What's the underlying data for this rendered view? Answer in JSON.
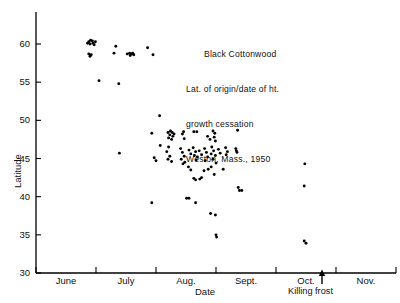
{
  "figure": {
    "title_lines": [
      "Black Cottonwood",
      "Lat. of origin/date of ht.",
      "growth cessation",
      "Weston, Mass., 1950"
    ],
    "frost_annotation": "Killing frost",
    "frost_arrow_icon": "up-arrow-icon"
  },
  "chart_data": {
    "type": "scatter",
    "title": "Black Cottonwood Lat. of origin/date of ht. growth cessation Weston, Mass., 1950",
    "xlabel": "Date",
    "ylabel": "Latitude",
    "ylim": [
      30,
      62
    ],
    "yticks": [
      30,
      35,
      40,
      45,
      50,
      55,
      60
    ],
    "ytick_labels": [
      "30",
      "35",
      "40",
      "45",
      "50",
      "55",
      "60"
    ],
    "xlim": [
      0,
      6
    ],
    "xtick_positions": [
      0,
      1,
      2,
      3,
      4,
      5,
      6
    ],
    "xtick_labels": [
      "June",
      "July",
      "Aug.",
      "Sept.",
      "Oct.",
      "Nov."
    ],
    "xlabel_positions": [
      0.5,
      1.5,
      2.5,
      3.5,
      4.5,
      5.5
    ],
    "grid": false,
    "legend": false,
    "annotations": [
      {
        "text": "Killing frost",
        "x": 4.95,
        "y": 30,
        "marker": "up-arrow"
      }
    ],
    "points": [
      {
        "x": 0.88,
        "y": 60.3
      },
      {
        "x": 0.91,
        "y": 60.5
      },
      {
        "x": 0.94,
        "y": 60.4
      },
      {
        "x": 0.9,
        "y": 60.0
      },
      {
        "x": 0.95,
        "y": 60.1
      },
      {
        "x": 0.99,
        "y": 60.3
      },
      {
        "x": 0.86,
        "y": 60.1
      },
      {
        "x": 0.97,
        "y": 59.9
      },
      {
        "x": 0.88,
        "y": 58.7
      },
      {
        "x": 0.92,
        "y": 58.6
      },
      {
        "x": 0.9,
        "y": 58.4
      },
      {
        "x": 1.33,
        "y": 59.7
      },
      {
        "x": 1.3,
        "y": 58.8
      },
      {
        "x": 1.52,
        "y": 58.7
      },
      {
        "x": 1.56,
        "y": 58.8
      },
      {
        "x": 1.6,
        "y": 58.7
      },
      {
        "x": 1.63,
        "y": 58.6
      },
      {
        "x": 1.57,
        "y": 58.5
      },
      {
        "x": 1.61,
        "y": 58.8
      },
      {
        "x": 1.86,
        "y": 59.5
      },
      {
        "x": 1.95,
        "y": 58.6
      },
      {
        "x": 1.05,
        "y": 55.2
      },
      {
        "x": 1.38,
        "y": 54.8
      },
      {
        "x": 1.39,
        "y": 45.7
      },
      {
        "x": 2.06,
        "y": 50.6
      },
      {
        "x": 1.93,
        "y": 48.3
      },
      {
        "x": 2.2,
        "y": 48.4
      },
      {
        "x": 2.24,
        "y": 48.6
      },
      {
        "x": 2.27,
        "y": 48.4
      },
      {
        "x": 2.23,
        "y": 48.1
      },
      {
        "x": 2.28,
        "y": 47.9
      },
      {
        "x": 2.21,
        "y": 47.7
      },
      {
        "x": 2.26,
        "y": 47.5
      },
      {
        "x": 2.3,
        "y": 48.2
      },
      {
        "x": 2.44,
        "y": 48.2
      },
      {
        "x": 2.47,
        "y": 47.6
      },
      {
        "x": 2.46,
        "y": 48.5
      },
      {
        "x": 2.63,
        "y": 48.5
      },
      {
        "x": 2.68,
        "y": 48.5
      },
      {
        "x": 2.95,
        "y": 48.6
      },
      {
        "x": 2.98,
        "y": 48.3
      },
      {
        "x": 3.36,
        "y": 48.7
      },
      {
        "x": 2.86,
        "y": 47.9
      },
      {
        "x": 2.9,
        "y": 47.5
      },
      {
        "x": 2.97,
        "y": 47.8
      },
      {
        "x": 2.99,
        "y": 47.3
      },
      {
        "x": 2.07,
        "y": 46.7
      },
      {
        "x": 2.21,
        "y": 46.5
      },
      {
        "x": 2.18,
        "y": 45.9
      },
      {
        "x": 2.23,
        "y": 45.3
      },
      {
        "x": 2.2,
        "y": 44.9
      },
      {
        "x": 2.26,
        "y": 44.6
      },
      {
        "x": 2.41,
        "y": 46.3
      },
      {
        "x": 2.44,
        "y": 45.8
      },
      {
        "x": 2.47,
        "y": 45.3
      },
      {
        "x": 2.42,
        "y": 44.9
      },
      {
        "x": 2.48,
        "y": 44.5
      },
      {
        "x": 2.45,
        "y": 44.3
      },
      {
        "x": 2.55,
        "y": 46.1
      },
      {
        "x": 2.58,
        "y": 45.6
      },
      {
        "x": 2.62,
        "y": 46.4
      },
      {
        "x": 2.66,
        "y": 45.9
      },
      {
        "x": 2.64,
        "y": 45.4
      },
      {
        "x": 2.69,
        "y": 45.2
      },
      {
        "x": 2.67,
        "y": 44.8
      },
      {
        "x": 2.72,
        "y": 46.0
      },
      {
        "x": 2.76,
        "y": 45.5
      },
      {
        "x": 2.81,
        "y": 46.3
      },
      {
        "x": 2.84,
        "y": 45.8
      },
      {
        "x": 2.86,
        "y": 45.2
      },
      {
        "x": 2.82,
        "y": 44.7
      },
      {
        "x": 2.93,
        "y": 46.5
      },
      {
        "x": 2.96,
        "y": 46.0
      },
      {
        "x": 2.92,
        "y": 45.6
      },
      {
        "x": 2.99,
        "y": 45.4
      },
      {
        "x": 2.95,
        "y": 44.9
      },
      {
        "x": 3.0,
        "y": 44.4
      },
      {
        "x": 3.04,
        "y": 46.2
      },
      {
        "x": 3.07,
        "y": 45.7
      },
      {
        "x": 3.16,
        "y": 46.4
      },
      {
        "x": 3.19,
        "y": 45.9
      },
      {
        "x": 3.17,
        "y": 45.5
      },
      {
        "x": 3.33,
        "y": 46.3
      },
      {
        "x": 3.35,
        "y": 45.8
      },
      {
        "x": 3.34,
        "y": 46.0
      },
      {
        "x": 2.54,
        "y": 43.9
      },
      {
        "x": 2.58,
        "y": 43.5
      },
      {
        "x": 2.63,
        "y": 42.4
      },
      {
        "x": 2.66,
        "y": 42.2
      },
      {
        "x": 2.73,
        "y": 42.3
      },
      {
        "x": 2.76,
        "y": 42.5
      },
      {
        "x": 2.8,
        "y": 43.4
      },
      {
        "x": 2.87,
        "y": 43.6
      },
      {
        "x": 2.92,
        "y": 43.9
      },
      {
        "x": 2.97,
        "y": 42.9
      },
      {
        "x": 3.12,
        "y": 43.6
      },
      {
        "x": 2.0,
        "y": 44.7
      },
      {
        "x": 1.97,
        "y": 45.1
      },
      {
        "x": 1.93,
        "y": 39.2
      },
      {
        "x": 2.51,
        "y": 39.8
      },
      {
        "x": 2.55,
        "y": 39.8
      },
      {
        "x": 2.66,
        "y": 39.2
      },
      {
        "x": 2.91,
        "y": 37.8
      },
      {
        "x": 2.99,
        "y": 37.6
      },
      {
        "x": 3.0,
        "y": 35.0
      },
      {
        "x": 3.01,
        "y": 34.7
      },
      {
        "x": 3.37,
        "y": 41.2
      },
      {
        "x": 3.39,
        "y": 40.8
      },
      {
        "x": 3.43,
        "y": 40.8
      },
      {
        "x": 4.48,
        "y": 44.3
      },
      {
        "x": 4.47,
        "y": 41.4
      },
      {
        "x": 4.47,
        "y": 34.2
      },
      {
        "x": 4.5,
        "y": 33.9
      }
    ]
  }
}
